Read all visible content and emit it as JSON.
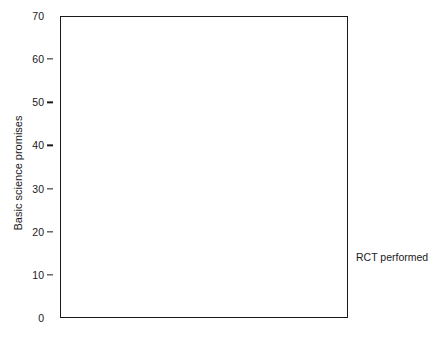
{
  "chart_data": {
    "type": "bar",
    "subtype": "stacked",
    "title": "",
    "xlabel": "",
    "ylabel": "Basic science promises",
    "categories": [
      "Industry author",
      "Industry support",
      "Neither"
    ],
    "series": [
      {
        "name": "No",
        "values": [
          5,
          10,
          59
        ],
        "color": "#b3b3b3"
      },
      {
        "name": "Yes",
        "values": [
          11,
          6,
          10
        ],
        "color": "#333333"
      }
    ],
    "totals": [
      16,
      16,
      69
    ],
    "ylim": [
      0,
      70
    ],
    "yticks": [
      0,
      10,
      20,
      30,
      40,
      50,
      60,
      70
    ],
    "ytick_labels": [
      "0",
      "10",
      "20",
      "30",
      "40",
      "50",
      "60",
      "70"
    ],
    "grid": false,
    "legend": {
      "title": "RCT performed",
      "position": "right-bottom",
      "entries": [
        {
          "label": "No",
          "color": "#b3b3b3"
        },
        {
          "label": "Yes",
          "color": "#333333"
        }
      ]
    },
    "frame": true,
    "colors": {
      "axis": "#1a1a1a",
      "no": "#b3b3b3",
      "yes": "#333333",
      "background": "#ffffff"
    }
  },
  "background_text": {
    "note": "faint illegible scanned bleed-through behind chart",
    "lines": [
      "a tepid analysis of the reporting of the clinical trial literature and the",
      "systematic objectives for comparing the recent published reports within",
      "biomedical research journals however such a translation of basic science",
      "claims into therapeutic benefit was rarely substantiated by evidence",
      "promises remained unevaluated in the majority of the sampled publications",
      "and only a minority of papers reported subsequent validation of the initial",
      "assertions the association of industry involvement with reporting of such",
      "claims was examined across the three mutually exclusive groupings defined",
      "above by the presence of an industry affiliated author industry funding",
      "support or neither and the proportion of articles that reported a randomised",
      "controlled trial within each category was subsequently tabulated below",
      "in the accompanying figure the stacked columns display the absolute",
      "counts of basic science promises identified in each stratum together with",
      "the corresponding randomised controlled trial performance status shown",
      "as separate shaded segments within each of the three vertical columns",
      "the largest group comprised articles with neither industry authorship nor",
      "industry support and within that group the overwhelming majority of the",
      "identified promises were not accompanied by any randomised controlled"
    ]
  }
}
